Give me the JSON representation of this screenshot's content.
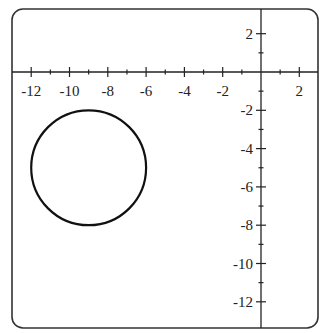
{
  "chart_data": {
    "type": "line",
    "title": "",
    "xlabel": "",
    "ylabel": "",
    "xlim": [
      -12.6,
      3.0
    ],
    "ylim": [
      -13.3,
      3.3
    ],
    "grid": false,
    "legend": null,
    "x_tick_labels": [
      "-12",
      "-10",
      "-8",
      "-6",
      "-4",
      "-2",
      "2"
    ],
    "x_ticks": [
      -12,
      -10,
      -8,
      -6,
      -4,
      -2,
      2
    ],
    "x_minor_ticks": [
      -11,
      -9,
      -7,
      -5,
      -3,
      -1,
      1
    ],
    "y_tick_labels": [
      "2",
      "-2",
      "-4",
      "-6",
      "-8",
      "-10",
      "-12"
    ],
    "y_ticks": [
      2,
      -2,
      -4,
      -6,
      -8,
      -10,
      -12
    ],
    "y_minor_ticks": [
      1,
      -1,
      -3,
      -5,
      -7,
      -9,
      -11
    ],
    "series": [
      {
        "name": "circle",
        "shape": "circle",
        "center": [
          -9,
          -5
        ],
        "radius": 3,
        "equation": "(x+9)^2 + (y+5)^2 = 9",
        "color": "#111111"
      }
    ]
  },
  "style": {
    "frame_color": "#333333",
    "axis_color": "#222222",
    "curve_color": "#111111"
  }
}
